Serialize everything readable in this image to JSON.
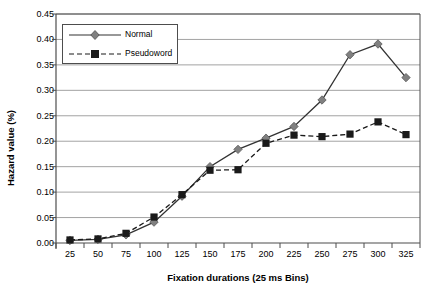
{
  "chart_data": {
    "type": "line",
    "title": "",
    "xlabel": "Fixation durations (25 ms Bins)",
    "ylabel": "Hazard value (%)",
    "categories": [
      "25",
      "50",
      "75",
      "100",
      "125",
      "150",
      "175",
      "200",
      "225",
      "250",
      "275",
      "300",
      "325"
    ],
    "xticks": [
      "25",
      "50",
      "75",
      "100",
      "125",
      "150",
      "175",
      "200",
      "225",
      "250",
      "275",
      "300",
      "325"
    ],
    "yticks": [
      "0.00",
      "0.05",
      "0.10",
      "0.15",
      "0.20",
      "0.25",
      "0.30",
      "0.35",
      "0.40",
      "0.45"
    ],
    "ylim": [
      0.0,
      0.45
    ],
    "ytick_step": 0.05,
    "grid": "horizontal",
    "legend_position": "upper-left-inside",
    "series": [
      {
        "name": "Normal",
        "marker": "diamond",
        "line_style": "solid",
        "color": "#808080",
        "line_color": "#333333",
        "values": [
          0.005,
          0.007,
          0.016,
          0.041,
          0.092,
          0.15,
          0.184,
          0.206,
          0.229,
          0.281,
          0.37,
          0.391,
          0.325
        ]
      },
      {
        "name": "Pseudoword",
        "marker": "square",
        "line_style": "dashed",
        "color": "#1a1a1a",
        "line_color": "#1a1a1a",
        "values": [
          0.006,
          0.008,
          0.019,
          0.051,
          0.095,
          0.143,
          0.144,
          0.196,
          0.212,
          0.209,
          0.214,
          0.238,
          0.213
        ]
      }
    ]
  },
  "legend": {
    "items": [
      {
        "label": "Normal"
      },
      {
        "label": "Pseudoword"
      }
    ]
  },
  "axes": {
    "x_title": "Fixation durations (25 ms Bins)",
    "y_title": "Hazard value (%)"
  }
}
